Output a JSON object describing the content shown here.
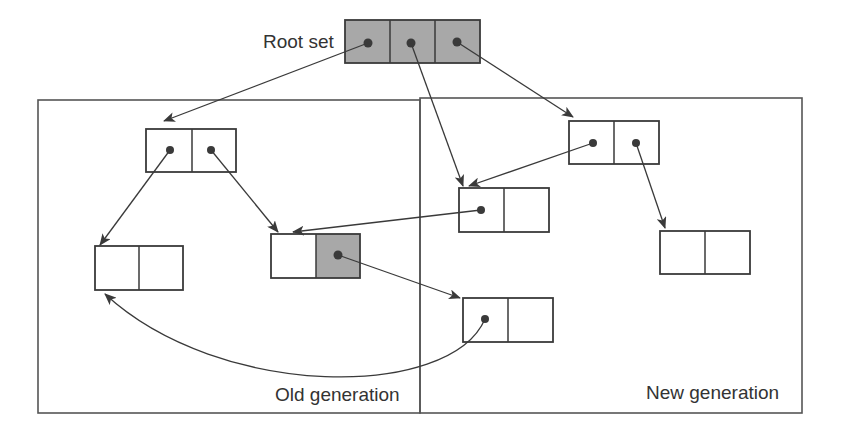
{
  "diagram": {
    "labels": {
      "root_set": "Root set",
      "old_generation": "Old generation",
      "new_generation": "New generation"
    },
    "colors": {
      "stroke": "#3a3a3a",
      "shade": "#a8a8a8",
      "background": "#ffffff"
    },
    "regions": [
      {
        "id": "old-generation",
        "label": "Old generation"
      },
      {
        "id": "new-generation",
        "label": "New generation"
      }
    ],
    "nodes": [
      {
        "id": "root",
        "region": "root",
        "cells": 3,
        "shaded": [
          0,
          1,
          2
        ],
        "pointers_from_cells": [
          0,
          1,
          2
        ]
      },
      {
        "id": "A",
        "region": "old-generation",
        "cells": 2,
        "shaded": [],
        "pointers_from_cells": [
          0,
          1
        ]
      },
      {
        "id": "B",
        "region": "old-generation",
        "cells": 2,
        "shaded": [],
        "pointers_from_cells": []
      },
      {
        "id": "C",
        "region": "old-generation",
        "cells": 2,
        "shaded": [
          1
        ],
        "pointers_from_cells": [
          1
        ]
      },
      {
        "id": "D",
        "region": "new-generation",
        "cells": 2,
        "shaded": [],
        "pointers_from_cells": [
          0,
          1
        ]
      },
      {
        "id": "E",
        "region": "new-generation",
        "cells": 2,
        "shaded": [],
        "pointers_from_cells": [
          0
        ]
      },
      {
        "id": "F",
        "region": "new-generation",
        "cells": 2,
        "shaded": [],
        "pointers_from_cells": []
      },
      {
        "id": "G",
        "region": "new-generation",
        "cells": 2,
        "shaded": [],
        "pointers_from_cells": [
          0
        ]
      }
    ],
    "edges": [
      {
        "from": "root.0",
        "to": "A"
      },
      {
        "from": "root.1",
        "to": "E"
      },
      {
        "from": "root.2",
        "to": "D"
      },
      {
        "from": "A.0",
        "to": "B"
      },
      {
        "from": "A.1",
        "to": "C"
      },
      {
        "from": "D.0",
        "to": "E"
      },
      {
        "from": "D.1",
        "to": "F"
      },
      {
        "from": "E.0",
        "to": "C"
      },
      {
        "from": "C.1",
        "to": "G"
      },
      {
        "from": "G.0",
        "to": "B",
        "curved": true
      }
    ]
  }
}
